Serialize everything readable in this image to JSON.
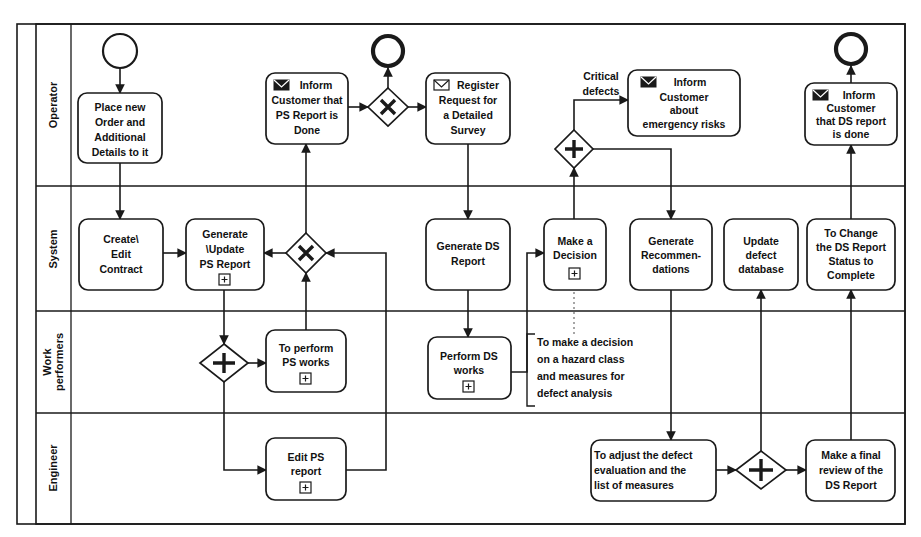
{
  "diagram": {
    "pool": {
      "lanes": [
        {
          "id": "operator",
          "label": "Operator"
        },
        {
          "id": "system",
          "label": "System"
        },
        {
          "id": "work_performers",
          "label": "Work performers"
        },
        {
          "id": "engineer",
          "label": "Engineer"
        }
      ]
    }
  },
  "events": [
    {
      "id": "start_operator",
      "type": "start-event",
      "lane": "operator",
      "label": ""
    },
    {
      "id": "end_ps",
      "type": "end-event",
      "lane": "operator",
      "label": ""
    },
    {
      "id": "end_ds",
      "type": "end-event",
      "lane": "operator",
      "label": ""
    }
  ],
  "gateways": [
    {
      "id": "gw_x_ps_top",
      "type": "exclusive-gateway",
      "lane": "operator",
      "glyph": "X",
      "label": ""
    },
    {
      "id": "gw_plus_critical",
      "type": "parallel-gateway",
      "lane": "operator",
      "glyph": "+",
      "label": ""
    },
    {
      "id": "gw_x_ps_system",
      "type": "exclusive-gateway",
      "lane": "system",
      "glyph": "X",
      "label": ""
    },
    {
      "id": "gw_plus_ps_works",
      "type": "parallel-gateway",
      "lane": "work_performers",
      "glyph": "+",
      "label": ""
    },
    {
      "id": "gw_plus_engineer",
      "type": "parallel-gateway",
      "lane": "engineer",
      "glyph": "+",
      "label": ""
    }
  ],
  "tasks": [
    {
      "id": "place_new_order",
      "lane": "operator",
      "lines": [
        "Place new",
        "Order and",
        "Additional",
        "Details to it"
      ],
      "icon": "",
      "marker": ""
    },
    {
      "id": "inform_ps_done",
      "lane": "operator",
      "lines": [
        "Inform",
        "Customer that",
        "PS Report is",
        "Done"
      ],
      "icon": "envelope-filled-icon",
      "marker": ""
    },
    {
      "id": "register_request",
      "lane": "operator",
      "lines": [
        "Register",
        "Request for",
        "a Detailed",
        "Survey"
      ],
      "icon": "envelope-open-icon",
      "marker": ""
    },
    {
      "id": "inform_emergency_risks",
      "lane": "operator",
      "lines": [
        "Inform",
        "Customer",
        "about",
        "emergency risks"
      ],
      "icon": "envelope-filled-icon",
      "marker": ""
    },
    {
      "id": "inform_ds_done",
      "lane": "operator",
      "lines": [
        "Inform",
        "Customer",
        "that DS report",
        "is done"
      ],
      "icon": "envelope-filled-icon",
      "marker": ""
    },
    {
      "id": "create_edit_contract",
      "lane": "system",
      "lines": [
        "Create\\",
        "Edit",
        "Contract"
      ],
      "icon": "",
      "marker": ""
    },
    {
      "id": "generate_update_ps_report",
      "lane": "system",
      "lines": [
        "Generate",
        "\\Update",
        "PS Report"
      ],
      "icon": "",
      "marker": "subprocess-plus-marker"
    },
    {
      "id": "generate_ds_report",
      "lane": "system",
      "lines": [
        "Generate DS",
        "Report"
      ],
      "icon": "",
      "marker": ""
    },
    {
      "id": "make_a_decision",
      "lane": "system",
      "lines": [
        "Make a",
        "Decision"
      ],
      "icon": "",
      "marker": "subprocess-plus-marker"
    },
    {
      "id": "generate_recommendations",
      "lane": "system",
      "lines": [
        "Generate",
        "Recommen-",
        "dations"
      ],
      "icon": "",
      "marker": ""
    },
    {
      "id": "update_defect_database",
      "lane": "system",
      "lines": [
        "Update",
        "defect",
        "database"
      ],
      "icon": "",
      "marker": ""
    },
    {
      "id": "change_ds_status",
      "lane": "system",
      "lines": [
        "To Change",
        "the DS Report",
        "Status to",
        "Complete"
      ],
      "icon": "",
      "marker": ""
    },
    {
      "id": "perform_ps_works",
      "lane": "work_performers",
      "lines": [
        "To perform",
        "PS works"
      ],
      "icon": "",
      "marker": "subprocess-plus-marker"
    },
    {
      "id": "perform_ds_works",
      "lane": "work_performers",
      "lines": [
        "Perform DS",
        "works"
      ],
      "icon": "",
      "marker": "subprocess-plus-marker"
    },
    {
      "id": "edit_ps_report",
      "lane": "engineer",
      "lines": [
        "Edit PS",
        "report"
      ],
      "icon": "",
      "marker": "subprocess-plus-marker"
    },
    {
      "id": "adjust_defect_evaluation",
      "lane": "engineer",
      "lines": [
        "To adjust the defect",
        "evaluation and the",
        "list of measures"
      ],
      "icon": "",
      "marker": ""
    },
    {
      "id": "final_review_ds_report",
      "lane": "engineer",
      "lines": [
        "Make a final",
        "review of the",
        "DS Report"
      ],
      "icon": "",
      "marker": ""
    }
  ],
  "flow_labels": [
    {
      "id": "critical_defects",
      "lines": [
        "Critical",
        "defects"
      ]
    }
  ],
  "annotations": [
    {
      "id": "decision_note",
      "lines": [
        "To make a decision",
        "on a hazard class",
        "and measures for",
        "defect analysis"
      ]
    }
  ],
  "colors": {
    "stroke": "#1a1a1a",
    "background": "#ffffff",
    "association": "#777777"
  }
}
